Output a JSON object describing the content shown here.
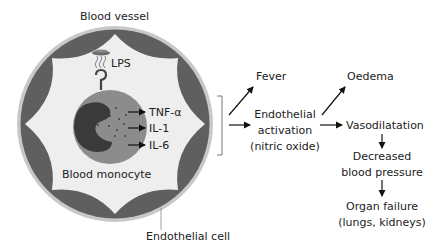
{
  "figure": {
    "vessel": {
      "label": "Blood vessel",
      "endothelial_label": "Endothelial cell",
      "colors": {
        "rim": "#c8c8c8",
        "endothelium": "#5f5f5f",
        "lumen": "#eeeeee"
      }
    },
    "lps": {
      "label": "LPS"
    },
    "monocyte": {
      "label": "Blood monocyte",
      "colors": {
        "cytoplasm": "#8c8c8c",
        "nucleus": "#3a3a3a",
        "granules": "#3a3a3a"
      }
    },
    "cytokines": [
      {
        "label": "TNF-α"
      },
      {
        "label": "IL-1"
      },
      {
        "label": "IL-6"
      }
    ],
    "effects": {
      "fever": "Fever",
      "endothelial_activation": [
        "Endothelial",
        "activation",
        "(nitric oxide)"
      ],
      "oedema": "Oedema",
      "vasodilatation": "Vasodilatation",
      "decreased_bp": [
        "Decreased",
        "blood pressure"
      ],
      "organ_failure": [
        "Organ failure",
        "(lungs, kidneys)"
      ]
    }
  }
}
